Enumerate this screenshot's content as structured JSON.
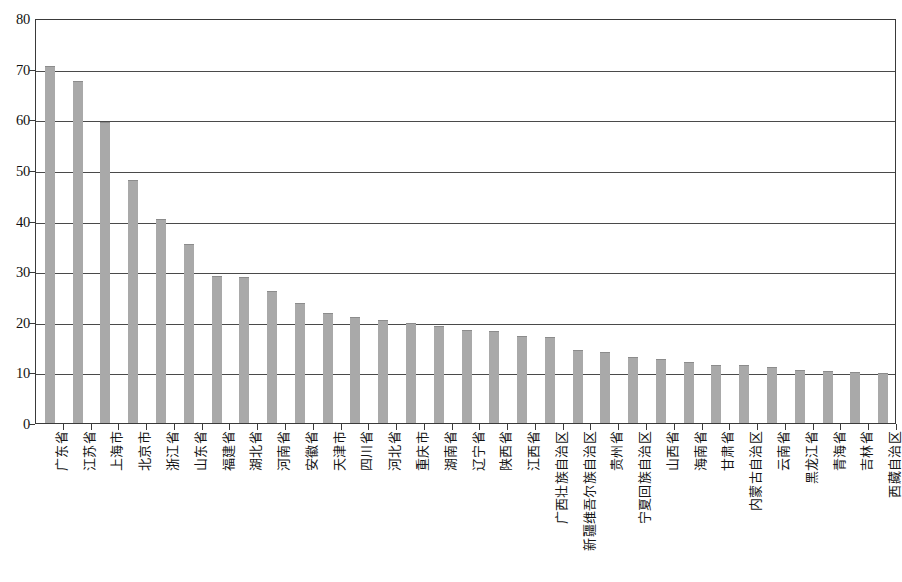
{
  "chart_data": {
    "type": "bar",
    "title": "",
    "subtitle": "",
    "xlabel": "",
    "ylabel": "",
    "ylim": [
      0,
      80
    ],
    "ytick_step": 10,
    "ytick_labels": [
      "80",
      "70",
      "60",
      "50",
      "40",
      "30",
      "20",
      "10",
      "0"
    ],
    "ytick_values": [
      80,
      70,
      60,
      50,
      40,
      30,
      20,
      10,
      0
    ],
    "grid": true,
    "grid_axis": "y",
    "legend": false,
    "legend_position": "none",
    "bar_color": "#a9a9a9",
    "axis_color": "#3a3a3a",
    "background_color": "#ffffff",
    "categories": [
      "广东省",
      "江苏省",
      "上海市",
      "北京市",
      "浙江省",
      "山东省",
      "福建省",
      "湖北省",
      "河南省",
      "安徽省",
      "天津市",
      "四川省",
      "河北省",
      "重庆市",
      "湖南省",
      "辽宁省",
      "陕西省",
      "江西省",
      "广西壮族自治区",
      "新疆维吾尔族自治区",
      "贵州省",
      "宁夏回族自治区",
      "山西省",
      "海南省",
      "甘肃省",
      "内蒙古自治区",
      "云南省",
      "黑龙江省",
      "青海省",
      "吉林省",
      "西藏自治区"
    ],
    "values": [
      70.5,
      67.5,
      59.5,
      48.0,
      40.3,
      35.3,
      29.0,
      28.9,
      26.0,
      23.7,
      21.8,
      21.0,
      20.3,
      19.7,
      19.2,
      18.4,
      18.1,
      17.1,
      16.9,
      14.5,
      14.0,
      13.1,
      12.7,
      12.1,
      11.5,
      11.4,
      11.1,
      10.5,
      10.3,
      10.1,
      9.8
    ]
  }
}
